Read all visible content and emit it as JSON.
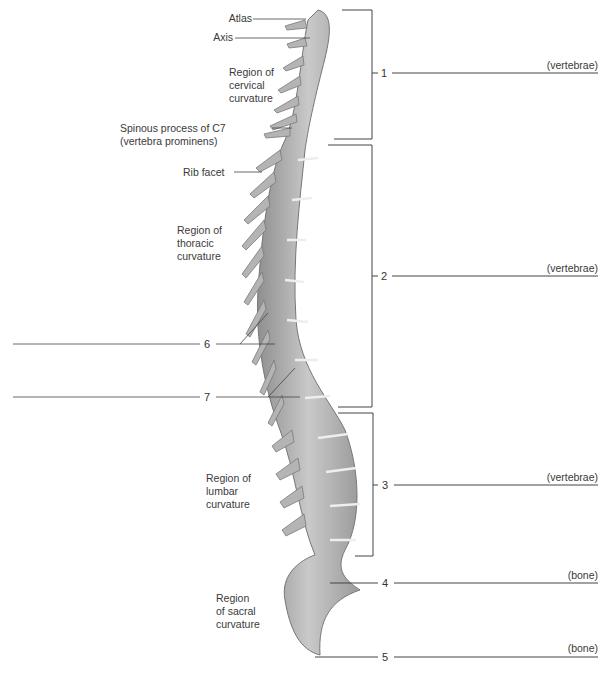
{
  "figure": {
    "left_labels": [
      {
        "id": "atlas",
        "text": "Atlas"
      },
      {
        "id": "axis",
        "text": "Axis"
      },
      {
        "id": "cervical_region",
        "text": "Region of\ncervical\ncurvature"
      },
      {
        "id": "c7",
        "text": "Spinous process of C7\n(vertebra prominens)"
      },
      {
        "id": "rib_facet",
        "text": "Rib facet"
      },
      {
        "id": "thoracic_region",
        "text": "Region of\nthoracic\ncurvature"
      },
      {
        "id": "lumbar_region",
        "text": "Region of\nlumbar\ncurvature"
      },
      {
        "id": "sacral_region",
        "text": "Region\nof sacral\ncurvature"
      }
    ],
    "numbered_blanks": [
      {
        "number": "1",
        "hint": "(vertebrae)"
      },
      {
        "number": "2",
        "hint": "(vertebrae)"
      },
      {
        "number": "3",
        "hint": "(vertebrae)"
      },
      {
        "number": "4",
        "hint": "(bone)"
      },
      {
        "number": "5",
        "hint": "(bone)"
      },
      {
        "number": "6",
        "hint": ""
      },
      {
        "number": "7",
        "hint": ""
      }
    ]
  }
}
